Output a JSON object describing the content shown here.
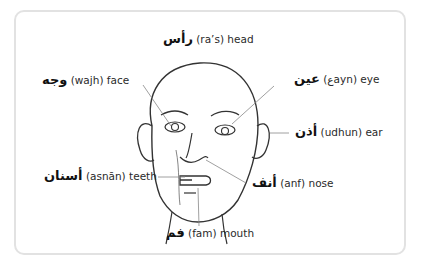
{
  "diagram": {
    "labels": [
      {
        "id": "head",
        "arabic": "رأس",
        "translit": "(ra’s)",
        "english": "head"
      },
      {
        "id": "face",
        "arabic": "وجه",
        "translit": "(wajh)",
        "english": "face"
      },
      {
        "id": "eye",
        "arabic": "عين",
        "translit": "(ﻉayn)",
        "english": "eye"
      },
      {
        "id": "ear",
        "arabic": "أذن",
        "translit": "(udhun)",
        "english": "ear"
      },
      {
        "id": "teeth",
        "arabic": "أسنان",
        "translit": "(asnān)",
        "english": "teeth"
      },
      {
        "id": "nose",
        "arabic": "أنف",
        "translit": "(anf)",
        "english": "nose"
      },
      {
        "id": "mouth",
        "arabic": "فم",
        "translit": "(fam)",
        "english": "mouth"
      }
    ]
  },
  "colors": {
    "frame_border": "#e2e2e2",
    "line": "#333333",
    "leader": "#888888"
  }
}
